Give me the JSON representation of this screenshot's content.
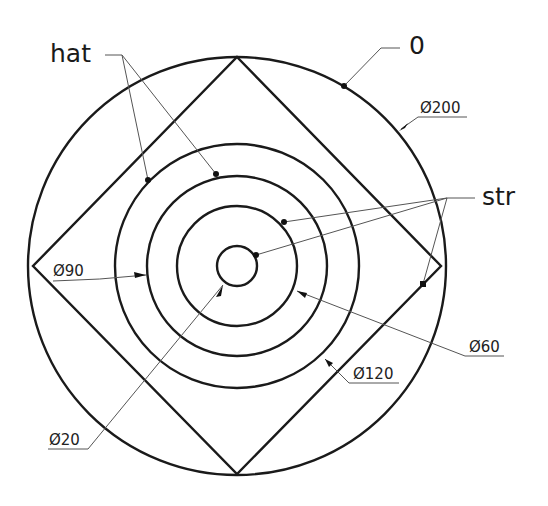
{
  "drawing": {
    "center": [
      237,
      266
    ],
    "outer_circle": {
      "diameter_label": "Ø200",
      "radius_px": 209
    },
    "circles": [
      {
        "label": "Ø120",
        "radius_px": 122
      },
      {
        "label": "Ø90",
        "radius_px": 91
      },
      {
        "label": "Ø60",
        "radius_px": 60
      },
      {
        "label": "Ø20",
        "radius_px": 20
      }
    ],
    "square": {
      "shape": "diamond inscribed in outer circle"
    }
  },
  "labels": {
    "hat": "hat",
    "zero": "0",
    "str": "str",
    "d200": "Ø200",
    "d90": "Ø90",
    "d60": "Ø60",
    "d120": "Ø120",
    "d20": "Ø20"
  },
  "colors": {
    "line": "#1a1a1a",
    "leader": "#555555",
    "background": "#ffffff"
  }
}
